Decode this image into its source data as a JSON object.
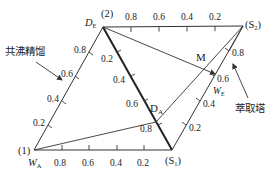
{
  "diagram": {
    "type": "ternary-phase-diagram",
    "colors": {
      "line": "#333333",
      "background": "#ffffff",
      "text": "#222222"
    },
    "vertices": {
      "top_left": {
        "id": "(2)",
        "sub_label": "D",
        "sub_label_sub": "E"
      },
      "top_right": {
        "id": "(S",
        "id_sub": "2",
        "id_close": ")"
      },
      "bottom_right": {
        "id": "(S",
        "id_sub": "1",
        "id_close": ")"
      },
      "bottom_left": {
        "id": "(1)",
        "sub_label": "W",
        "sub_label_sub": "A"
      }
    },
    "edges": {
      "top": {
        "ticks": [
          "0.8",
          "0.6",
          "0.4",
          "0.2"
        ]
      },
      "bottom": {
        "ticks": [
          "0.8",
          "0.6",
          "0.4",
          "0.2"
        ]
      },
      "left": {
        "ticks": [
          "0.2",
          "0.4",
          "0.6",
          "0.8"
        ]
      },
      "right": {
        "ticks": [
          "0.2",
          "0.4",
          "0.6",
          "0.8"
        ],
        "axis_label": "W",
        "axis_label_sub": "E"
      },
      "diagonal": {
        "ticks": [
          "0.2",
          "0.4",
          "0.6",
          "0.8"
        ]
      }
    },
    "points": {
      "M": "M",
      "DA": "D",
      "DA_sub": "A"
    },
    "annotations": {
      "left": "共沸精馏",
      "right": "萃取塔"
    }
  }
}
